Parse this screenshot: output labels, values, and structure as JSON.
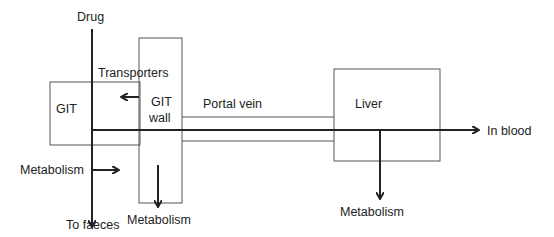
{
  "diagram": {
    "type": "flow",
    "boxes": {
      "git": "GIT",
      "git_wall_line1": "GIT",
      "git_wall_line2": "wall",
      "liver": "Liver"
    },
    "labels": {
      "drug": "Drug",
      "transporters": "Transporters",
      "portal_vein": "Portal vein",
      "in_blood": "In blood",
      "metabolism_left": "Metabolism",
      "to_faeces": "To faeces",
      "metabolism_wall": "Metabolism",
      "metabolism_liver": "Metabolism"
    },
    "colors": {
      "line": "#222222",
      "box_border": "#555555"
    }
  }
}
